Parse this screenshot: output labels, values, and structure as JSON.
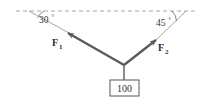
{
  "figure": {
    "type": "free-body-force-diagram",
    "title": "",
    "background_color": "#ffffff",
    "angles": {
      "left": {
        "value": "30",
        "degree_symbol": "°",
        "full": "30°"
      },
      "right": {
        "value": "45",
        "degree_symbol": "°",
        "full": "45°"
      }
    },
    "forces": {
      "left": {
        "symbol": "F",
        "subscript": "1",
        "full": "F1"
      },
      "right": {
        "symbol": "F",
        "subscript": "2",
        "full": "F2"
      }
    },
    "weight": {
      "value": "100"
    },
    "colors": {
      "vector": "#5a5a5a",
      "guide_line": "#9a9a9a",
      "dashed_line": "#a8a8a8",
      "text": "#333333",
      "box_border": "#555555",
      "background": "#ffffff"
    }
  }
}
